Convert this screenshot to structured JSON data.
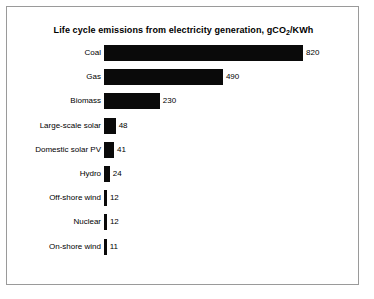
{
  "chart_data": {
    "type": "bar",
    "orientation": "horizontal",
    "title": "Life cycle emissions from electricity generation, gCO",
    "title_sub": "2",
    "title_tail": "/KWh",
    "title_full": "Life cycle emissions from electricity generation, gCO2/KWh",
    "xlabel": "",
    "ylabel": "",
    "xlim": [
      0,
      820
    ],
    "grid": false,
    "legend": null,
    "bar_color": "#0a0a0a",
    "categories": [
      "Coal",
      "Gas",
      "Biomass",
      "Large-scale solar",
      "Domestic solar PV",
      "Hydro",
      "Off-shore wind",
      "Nuclear",
      "On-shore wind"
    ],
    "values": [
      820,
      490,
      230,
      48,
      41,
      24,
      12,
      12,
      11
    ],
    "value_labels": [
      "820",
      "490",
      "230",
      "48",
      "41",
      "24",
      "12",
      "12",
      "11"
    ]
  },
  "frame": {
    "border_color": "#9a9a9a",
    "background": "#ffffff"
  }
}
